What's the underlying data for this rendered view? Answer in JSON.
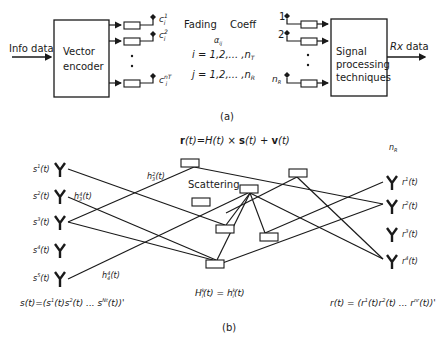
{
  "part_a": {
    "input_label": "Info data",
    "encoder": {
      "line1": "Vector",
      "line2": "encoder"
    },
    "tx_outputs": [
      {
        "label": "c",
        "sup": "1",
        "sub": "i"
      },
      {
        "label": "c",
        "sup": "2",
        "sub": "i"
      },
      {
        "label": "c",
        "sup": "nT",
        "sub": "i"
      }
    ],
    "fading": {
      "title_left": "Fading",
      "title_right": "Coeff",
      "symbol": "α",
      "symbol_sub": "ij",
      "i_range": "i = 1,2,... ,n",
      "i_range_sub": "T",
      "j_range": "j = 1,2,... ,n",
      "j_range_sub": "R"
    },
    "rx_inputs": [
      {
        "label": "1"
      },
      {
        "label": "2"
      },
      {
        "label": "n",
        "sub": "R"
      }
    ],
    "processor": {
      "line1": "Signal",
      "line2": "processing",
      "line3": "techniques"
    },
    "output_label_italic": "Rx",
    "output_label": " data",
    "caption": "(a)"
  },
  "part_b": {
    "equation": {
      "r": "r",
      "p1": "(t)=",
      "H": "H",
      "p2": "(t) × ",
      "s": "s",
      "p3": "(t) + ",
      "v": "v",
      "p4": "(t)"
    },
    "nr_label": "n",
    "nr_sub": "R",
    "scattering_label": "Scattering",
    "tx_antennas": [
      {
        "label": "s",
        "sup": "1",
        "arg": "(t)"
      },
      {
        "label": "s",
        "sup": "2",
        "arg": "(t)"
      },
      {
        "label": "s",
        "sup": "3",
        "arg": "(t)"
      },
      {
        "label": "s",
        "sup": "4",
        "arg": "(t)"
      },
      {
        "label": "s",
        "sup": "5",
        "arg": "(t)"
      }
    ],
    "rx_antennas": [
      {
        "label": "r",
        "sup": "1",
        "arg": "(t)"
      },
      {
        "label": "r",
        "sup": "2",
        "arg": "(t)"
      },
      {
        "label": "r",
        "sup": "3",
        "arg": "(t)"
      },
      {
        "label": "r",
        "sup": "4",
        "arg": "(t)"
      }
    ],
    "path_labels": [
      {
        "h": "h",
        "sub": "3",
        "sup": "2",
        "arg": "(t)"
      },
      {
        "h": "h",
        "sub": "3",
        "sup": "4",
        "arg": "(t)"
      },
      {
        "h": "h",
        "sub": "4",
        "sup": "4",
        "arg": "(t)"
      }
    ],
    "channel_eq": "H",
    "channel_eq_sub": "i",
    "channel_eq_sup": "k",
    "channel_eq_rest": "(t) = h",
    "channel_eq_rest2": "(t)",
    "tx_vector": "s(t)=(s",
    "tx_vector_mid": "(t)s",
    "tx_vector_end": "(t) ... s",
    "tx_vector_sup_end": "Nt",
    "tx_vector_close": "(t))'",
    "rx_vector": "r(t) = (r",
    "rx_vector_mid": "(t)r",
    "rx_vector_end": "(t) ... r",
    "rx_vector_sup_end": "nr",
    "rx_vector_close": "(t))'",
    "caption": "(b)"
  }
}
